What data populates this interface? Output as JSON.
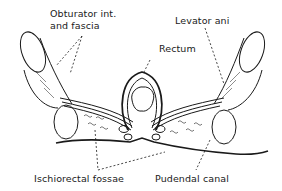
{
  "diagram": {
    "type": "anatomical cross-section",
    "colors": {
      "ink": "#1a1a1a",
      "background": "#ffffff"
    },
    "labels": {
      "obturator_line1": "Obturator int.",
      "obturator_line2": "and fascia",
      "levator": "Levator ani",
      "rectum": "Rectum",
      "ischiorectal": "Ischiorectal fossae",
      "pudendal": "Pudendal canal"
    }
  }
}
